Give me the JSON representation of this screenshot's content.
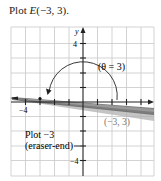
{
  "figure": {
    "title_prefix": "Plot ",
    "title_point": "E",
    "title_coords": "(−3, 3)."
  },
  "axes": {
    "x_label": "x",
    "y_label": "y",
    "tick_y_pos": "4",
    "tick_y_neg": "−4",
    "tick_x_neg": "−4",
    "grid": true,
    "range": [
      -5,
      5
    ]
  },
  "annotations": {
    "theta_label": "(θ = 3)",
    "point_label": "(−3, 3)",
    "note_line1": "Plot −3",
    "note_line2": "(eraser-end)"
  },
  "colors": {
    "grid": "#c8c8c8",
    "axis": "#222222",
    "pencil_dark": "#555555",
    "pencil_light": "#b0b0b0",
    "label_gray": "#777777"
  }
}
